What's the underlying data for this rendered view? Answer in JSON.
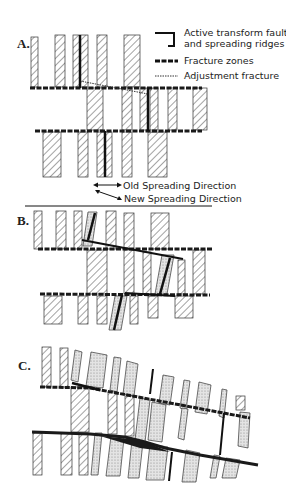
{
  "figure": {
    "panels": [
      {
        "label": "A."
      },
      {
        "label": "B."
      },
      {
        "label": "C."
      }
    ],
    "legend": {
      "items": [
        {
          "symbol": "active-transform-fault-icon",
          "text_line1": "Active transform faults",
          "text_line2": "and spreading ridges"
        },
        {
          "symbol": "fracture-zone-icon",
          "text": "Fracture zones"
        },
        {
          "symbol": "adjustment-fracture-icon",
          "text": "Adjustment fracture"
        }
      ]
    },
    "directions": {
      "old": "Old Spreading Direction",
      "new": "New Spreading Direction"
    },
    "colors": {
      "ink": "#1a1a1a",
      "stipple": "#cfcfcf",
      "background": "#ffffff"
    }
  }
}
